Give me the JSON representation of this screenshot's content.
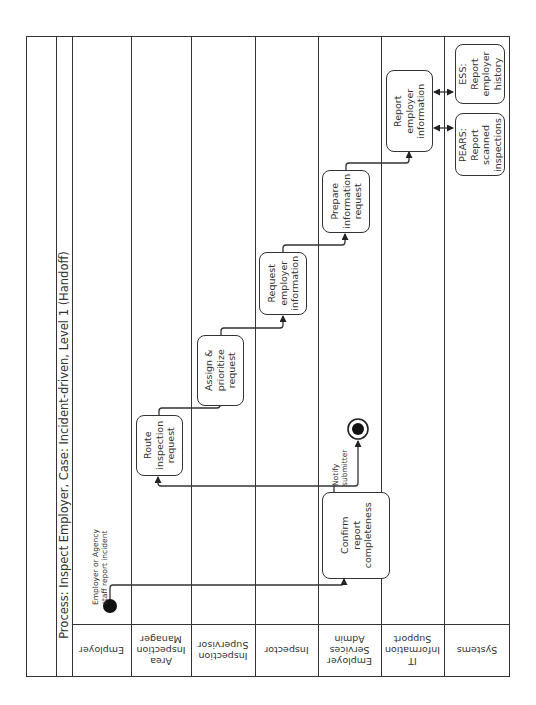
{
  "title": "Process: Inspect Employer,  Case: Incident-driven, Level 1 (Handoff)",
  "lanes": [
    {
      "label": "Employer"
    },
    {
      "label": "Area Inspection Manager"
    },
    {
      "label": "Inspection Supervisor"
    },
    {
      "label": "Inspector"
    },
    {
      "label": "Employer Services Admin"
    },
    {
      "label": "IT Information Support"
    },
    {
      "label": "Systems"
    }
  ],
  "events": {
    "start": {
      "label": "Employer or Agency staff report incident"
    },
    "end": {
      "label": "Notify submitter"
    }
  },
  "tasks": [
    {
      "id": "route",
      "label": "Route inspection request",
      "lane": "Area Inspection Manager"
    },
    {
      "id": "assign",
      "label": "Assign & prioritize request",
      "lane": "Inspection Supervisor"
    },
    {
      "id": "request",
      "label": "Request employer information",
      "lane": "Inspector"
    },
    {
      "id": "confirm",
      "label": "Confirm report completeness",
      "lane": "Employer Services Admin"
    },
    {
      "id": "prepare",
      "label": "Prepare information request",
      "lane": "Employer Services Admin"
    },
    {
      "id": "report",
      "label": "Report employer information",
      "lane": "IT Information Support"
    },
    {
      "id": "ess",
      "label": "ESS: Report employer history",
      "lane": "Systems"
    },
    {
      "id": "pears",
      "label": "PEARS: Report scanned inspections",
      "lane": "Systems"
    }
  ],
  "flows": [
    {
      "from": "start",
      "to": "confirm"
    },
    {
      "from": "confirm",
      "to": "route"
    },
    {
      "from": "confirm",
      "to": "end",
      "label": "Notify submitter"
    },
    {
      "from": "route",
      "to": "assign"
    },
    {
      "from": "assign",
      "to": "request"
    },
    {
      "from": "request",
      "to": "prepare"
    },
    {
      "from": "prepare",
      "to": "report"
    },
    {
      "from": "report",
      "to": "ess",
      "bidirectional": true
    },
    {
      "from": "report",
      "to": "pears",
      "bidirectional": true
    }
  ],
  "colors": {
    "line": "#333333",
    "background": "#ffffff"
  }
}
